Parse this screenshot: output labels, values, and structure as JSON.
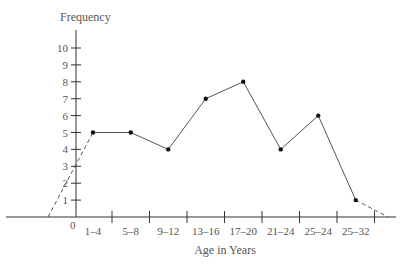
{
  "chart_data": {
    "type": "line",
    "title": "",
    "xlabel": "Age in Years",
    "ylabel": "Frequency",
    "categories": [
      "1-4",
      "5-8",
      "9-12",
      "13-16",
      "17-20",
      "21-24",
      "25-24",
      "25-32"
    ],
    "values": [
      5,
      5,
      4,
      7,
      8,
      4,
      6,
      1
    ],
    "ylim": [
      0,
      10
    ],
    "yticks": [
      1,
      2,
      3,
      4,
      5,
      6,
      7,
      8,
      9,
      10
    ],
    "origin_label": "0",
    "grid": false,
    "legend": null,
    "annotations": [
      "dashed line extends from first point down to the x-axis left of the y-axis",
      "dashed line extends from last point down to the x-axis at the right end"
    ],
    "series": [
      {
        "name": "Frequency",
        "values": [
          5,
          5,
          4,
          7,
          8,
          4,
          6,
          1
        ]
      }
    ]
  },
  "labels": {
    "ylabel": "Frequency",
    "xlabel": "Age in Years",
    "origin": "0"
  },
  "colors": {
    "axis": "#333333",
    "line": "#555555",
    "point": "#111111",
    "text": "#555555"
  }
}
